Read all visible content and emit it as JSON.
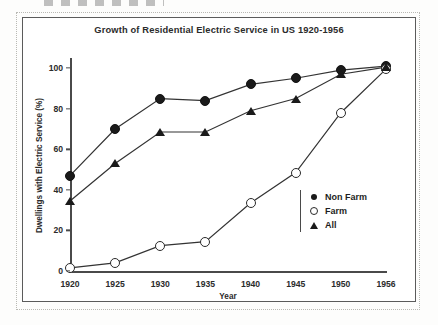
{
  "chart_data": {
    "type": "line",
    "title": "Growth of Residential Electric Service in US 1920-1956",
    "xlabel": "Year",
    "ylabel": "Dwellings with Electric Service (%)",
    "categories": [
      "1920",
      "1925",
      "1930",
      "1935",
      "1940",
      "1945",
      "1950",
      "1956"
    ],
    "xtick_labels": [
      "1920",
      "1925",
      "1930",
      "1935",
      "1940",
      "1945",
      "1950",
      "1956"
    ],
    "ytick_labels": [
      "0",
      "20",
      "40",
      "60",
      "80",
      "100"
    ],
    "ytick_values": [
      0,
      20,
      40,
      60,
      80,
      100
    ],
    "ylim": [
      0,
      104
    ],
    "grid": false,
    "legend_position": "inside-right",
    "series": [
      {
        "name": "Non Farm",
        "marker": "filled-circle",
        "values": [
          47,
          70,
          85,
          84,
          92,
          95,
          99,
          101
        ]
      },
      {
        "name": "Farm",
        "marker": "open-circle",
        "values": [
          1.5,
          4,
          12.5,
          14.5,
          33.5,
          48.5,
          78,
          99.5
        ]
      },
      {
        "name": "All",
        "marker": "filled-triangle",
        "values": [
          34.5,
          53,
          68.5,
          68.5,
          79,
          85,
          97,
          100.5
        ]
      }
    ]
  },
  "legend": {
    "entries": [
      {
        "label": "Non Farm",
        "symbol": "filled-circle-icon"
      },
      {
        "label": "Farm",
        "symbol": "open-circle-icon"
      },
      {
        "label": "All",
        "symbol": "filled-triangle-icon"
      }
    ]
  }
}
